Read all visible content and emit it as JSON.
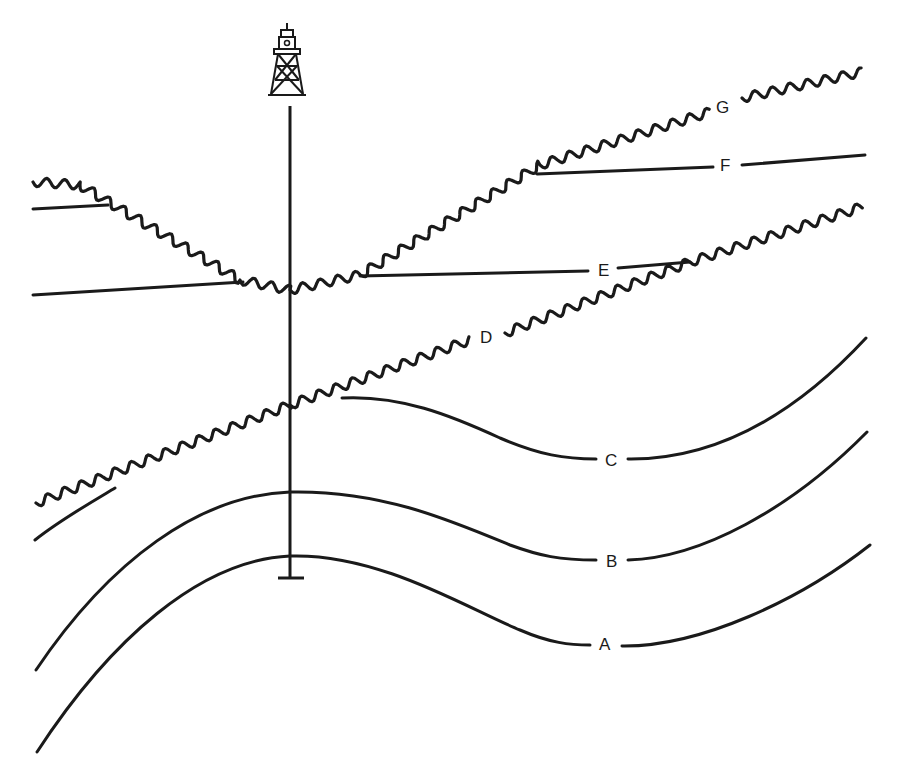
{
  "diagram": {
    "type": "geologic-cross-section",
    "colors": {
      "ink": "#1a1a1a",
      "background": "#ffffff"
    },
    "labels": {
      "A": "A",
      "B": "B",
      "C": "C",
      "D": "D",
      "E": "E",
      "F": "F",
      "G": "G"
    },
    "beds": [
      {
        "id": "A",
        "kind": "conformable-folded"
      },
      {
        "id": "B",
        "kind": "conformable-folded"
      },
      {
        "id": "C",
        "kind": "conformable-folded"
      },
      {
        "id": "D",
        "kind": "unconformity"
      },
      {
        "id": "E",
        "kind": "planar-bed"
      },
      {
        "id": "F",
        "kind": "planar-bed"
      },
      {
        "id": "G",
        "kind": "unconformity"
      }
    ],
    "well": {
      "icon": "oil-derrick-icon",
      "total_depth_marker": "well-bottom-tick"
    }
  }
}
